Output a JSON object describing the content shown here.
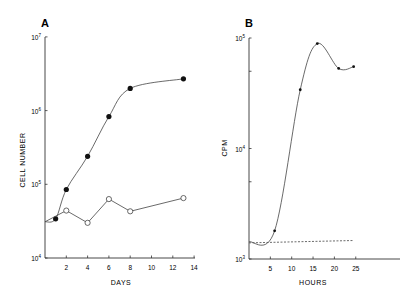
{
  "chart_data": [
    {
      "type": "line",
      "panel": "A",
      "title": "A",
      "xlabel": "DAYS",
      "ylabel": "CELL NUMBER",
      "yscale": "log",
      "xlim": [
        0,
        14
      ],
      "ylim": [
        10000,
        10000000
      ],
      "x_ticks": [
        "2",
        "4",
        "6",
        "8",
        "10",
        "12",
        "14"
      ],
      "y_ticks": [
        {
          "base": "10",
          "exp": "7"
        },
        {
          "base": "10",
          "exp": "6"
        },
        {
          "base": "10",
          "exp": "5"
        },
        {
          "base": "10",
          "exp": "4"
        }
      ],
      "grid": false,
      "series": [
        {
          "name": "filled circles",
          "marker": "filled-circle",
          "curve": "smooth",
          "x": [
            0,
            1,
            2,
            4,
            6,
            8,
            13
          ],
          "values": [
            31000,
            34000,
            85000,
            240000,
            830000,
            2000000,
            2700000
          ],
          "markers_at": [
            1,
            2,
            3,
            4,
            5,
            6
          ]
        },
        {
          "name": "open circles",
          "marker": "open-circle",
          "curve": "straight",
          "x": [
            0,
            2,
            4,
            6,
            8,
            13
          ],
          "values": [
            31000,
            44000,
            30000,
            63000,
            43000,
            65000
          ],
          "markers_at": [
            1,
            2,
            3,
            4,
            5
          ]
        }
      ]
    },
    {
      "type": "line",
      "panel": "B",
      "title": "B",
      "xlabel": "HOURS",
      "ylabel": "CPM",
      "yscale": "log",
      "xlim": [
        0,
        35
      ],
      "ylim": [
        1000,
        100000
      ],
      "x_ticks": [
        "5",
        "10",
        "15",
        "20",
        "25"
      ],
      "y_ticks": [
        {
          "base": "10",
          "exp": "5"
        },
        {
          "base": "10",
          "exp": "4"
        },
        {
          "base": "10",
          "exp": "3"
        }
      ],
      "grid": false,
      "series": [
        {
          "name": "solid curve",
          "marker": "small-dot",
          "curve": "smooth",
          "x": [
            0,
            6,
            12,
            16,
            21,
            24.5
          ],
          "values": [
            1430,
            1800,
            34000,
            89000,
            53000,
            55000
          ],
          "markers_at": [
            1,
            2,
            3,
            4,
            5
          ]
        },
        {
          "name": "dashed baseline",
          "marker": "none",
          "curve": "dashed",
          "x": [
            0,
            24.5
          ],
          "values": [
            1400,
            1470
          ]
        }
      ]
    }
  ]
}
